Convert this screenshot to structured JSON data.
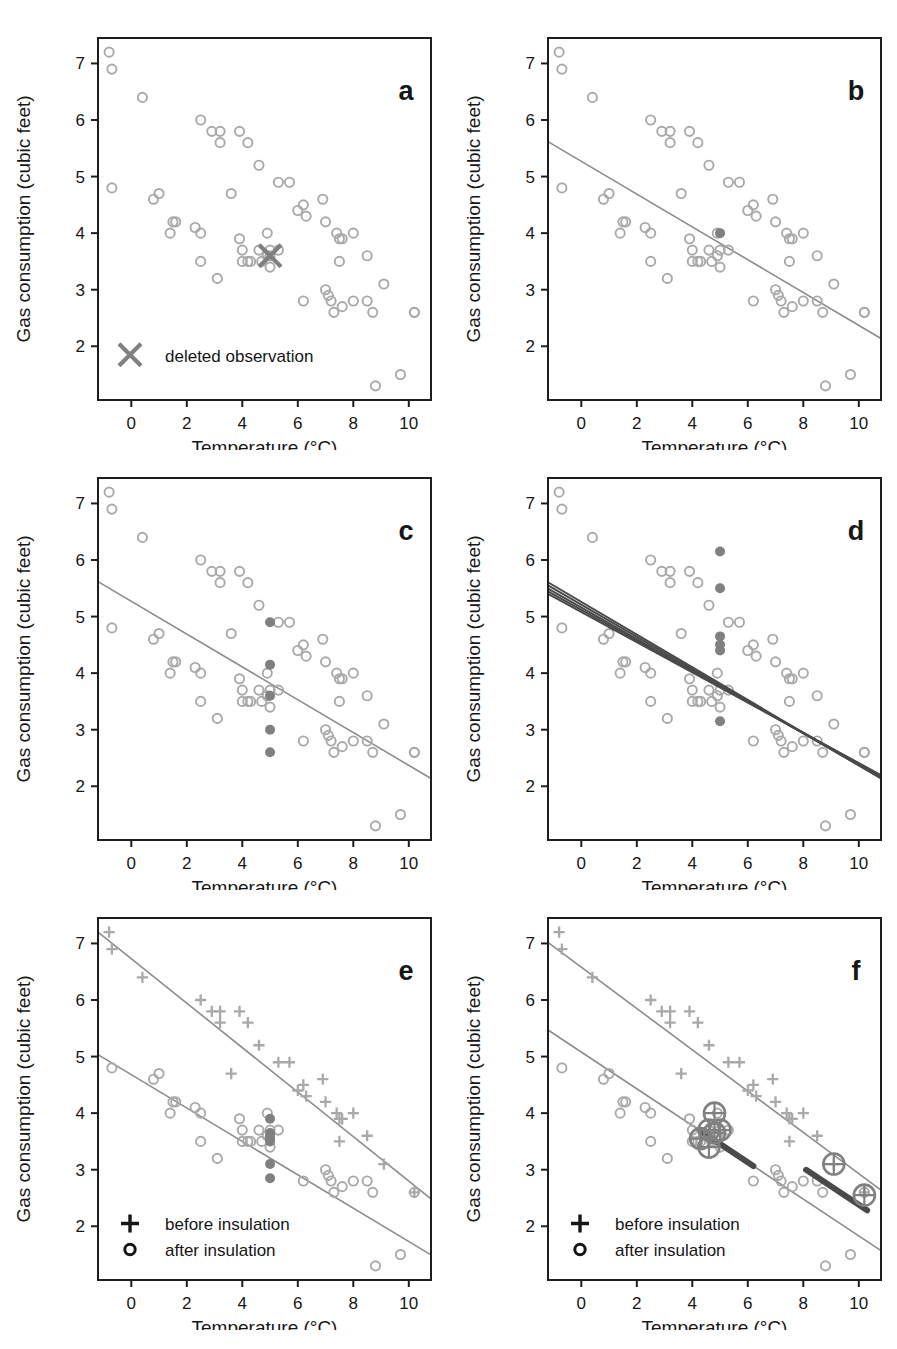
{
  "figure": {
    "axis": {
      "xlabel": "Temperature (°C)",
      "ylabel": "Gas consumption (cubic feet)",
      "xticks": [
        "0",
        "2",
        "4",
        "6",
        "8",
        "10"
      ],
      "yticks": [
        "2",
        "3",
        "4",
        "5",
        "6",
        "7"
      ],
      "xlim": [
        -1.2,
        10.8
      ],
      "ylim": [
        1.05,
        7.45
      ]
    },
    "colors": {
      "open_marker": "#a9a9a9",
      "filled_marker": "#808080",
      "line": "#8c8c8c",
      "dark_line": "#4a4a4a",
      "axis": "#1d1d1d",
      "text": "#161616"
    },
    "panels": [
      {
        "id": "a",
        "label": "a",
        "legend": [
          {
            "symbol": "x-marker",
            "text": "deleted observation"
          }
        ],
        "lines": [],
        "notes": "scatter of all observations with one point marked by a cross"
      },
      {
        "id": "b",
        "label": "b",
        "legend": [],
        "lines": [
          {
            "intercept": 5.27,
            "slope": -0.29
          }
        ],
        "notes": "single least-squares fit, one filled highlighted point"
      },
      {
        "id": "c",
        "label": "c",
        "legend": [],
        "lines": [
          {
            "intercept": 5.27,
            "slope": -0.29
          }
        ],
        "notes": "same fit, several candidate values for the deleted observation"
      },
      {
        "id": "d",
        "label": "d",
        "legend": [],
        "lines": [
          {
            "intercept": 5.26,
            "slope": -0.289
          },
          {
            "intercept": 5.21,
            "slope": -0.284
          },
          {
            "intercept": 5.16,
            "slope": -0.278
          },
          {
            "intercept": 5.12,
            "slope": -0.272
          },
          {
            "intercept": 5.08,
            "slope": -0.267
          }
        ],
        "notes": "fan of fitted lines for each imputed value"
      },
      {
        "id": "e",
        "label": "e",
        "legend": [
          {
            "symbol": "plus-marker",
            "text": "before insulation"
          },
          {
            "symbol": "circle-marker",
            "text": "after insulation"
          }
        ],
        "lines": [
          {
            "intercept": 6.73,
            "slope": -0.393,
            "group": "before insulation"
          },
          {
            "intercept": 4.68,
            "slope": -0.295,
            "group": "after insulation"
          }
        ],
        "notes": "two-group regression, before and after insulation"
      },
      {
        "id": "f",
        "label": "f",
        "legend": [
          {
            "symbol": "plus-marker",
            "text": "before insulation"
          },
          {
            "symbol": "circle-marker",
            "text": "after insulation"
          }
        ],
        "lines": [
          {
            "intercept": 6.58,
            "slope": -0.365,
            "group": "before insulation"
          },
          {
            "intercept": 5.08,
            "slope": -0.325,
            "group": "after insulation"
          }
        ],
        "notes": "influential observations highlighted with encircled plus symbols"
      }
    ]
  },
  "chart_data": {
    "type": "scatter",
    "title": "",
    "xlabel": "Temperature (°C)",
    "ylabel": "Gas consumption (cubic feet)",
    "xlim": [
      -1.2,
      10.8
    ],
    "ylim": [
      1.05,
      7.45
    ],
    "grid": false,
    "legend_position": "lower-left",
    "series": [
      {
        "name": "before insulation",
        "marker": "plus",
        "x": [
          -0.8,
          -0.7,
          0.4,
          2.5,
          2.9,
          3.2,
          3.2,
          3.6,
          3.9,
          4.2,
          4.6,
          5.3,
          5.7,
          6.0,
          6.2,
          6.3,
          6.9,
          7.0,
          7.4,
          7.5,
          7.5,
          7.6,
          8.0,
          8.5,
          9.1,
          10.2
        ],
        "y": [
          7.2,
          6.9,
          6.4,
          6.0,
          5.8,
          5.8,
          5.6,
          4.7,
          5.8,
          5.6,
          5.2,
          4.9,
          4.9,
          4.4,
          4.5,
          4.3,
          4.6,
          4.2,
          4.0,
          3.9,
          3.5,
          3.9,
          4.0,
          3.6,
          3.1,
          2.6
        ]
      },
      {
        "name": "after insulation",
        "marker": "circle",
        "x": [
          -0.7,
          0.8,
          1.0,
          1.4,
          1.5,
          1.6,
          2.3,
          2.5,
          2.5,
          3.1,
          3.9,
          4.0,
          4.0,
          4.2,
          4.3,
          4.6,
          4.7,
          4.9,
          4.9,
          5.0,
          5.0,
          5.3,
          6.2,
          7.0,
          7.1,
          7.2,
          7.3,
          7.6,
          8.0,
          8.5,
          8.8,
          8.7,
          9.7,
          10.2
        ],
        "y": [
          4.8,
          4.6,
          4.7,
          4.0,
          4.2,
          4.2,
          4.1,
          4.0,
          3.5,
          3.2,
          3.9,
          3.5,
          3.7,
          3.5,
          3.5,
          3.7,
          3.5,
          3.6,
          4.0,
          3.4,
          3.7,
          3.7,
          2.8,
          3.0,
          2.9,
          2.8,
          2.6,
          2.7,
          2.8,
          2.8,
          1.3,
          2.6,
          1.5,
          2.6
        ]
      }
    ],
    "deleted_observation": {
      "x": 5.0,
      "y": 3.6,
      "label": "deleted observation"
    },
    "imputed_values_panel_c": [
      2.6,
      3.0,
      3.6,
      4.15,
      4.9
    ],
    "imputed_values_panel_d": [
      3.15,
      4.4,
      4.5,
      4.65,
      5.5,
      6.15
    ],
    "influential_points_panel_f": [
      {
        "x": 4.8,
        "y": 4.0
      },
      {
        "x": 4.6,
        "y": 3.7
      },
      {
        "x": 5.0,
        "y": 3.7
      },
      {
        "x": 4.8,
        "y": 3.65
      },
      {
        "x": 4.3,
        "y": 3.55
      },
      {
        "x": 4.6,
        "y": 3.4
      },
      {
        "x": 9.1,
        "y": 3.1
      },
      {
        "x": 10.2,
        "y": 2.55
      }
    ]
  }
}
